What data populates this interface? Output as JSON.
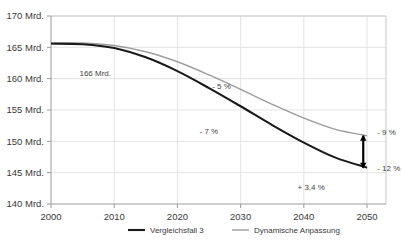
{
  "chart_data": {
    "type": "line",
    "title": "",
    "xlabel": "",
    "ylabel": "",
    "xlim": [
      2000,
      2053
    ],
    "ylim": [
      140,
      170
    ],
    "grid": true,
    "legend_position": "bottom",
    "x_ticks": [
      "2000",
      "2010",
      "2020",
      "2030",
      "2040",
      "2050"
    ],
    "x_tick_values": [
      2000,
      2010,
      2020,
      2030,
      2040,
      2050
    ],
    "y_ticks": [
      "140 Mrd.",
      "145 Mrd.",
      "150 Mrd.",
      "155 Mrd.",
      "160 Mrd.",
      "165 Mrd.",
      "170 Mrd."
    ],
    "y_tick_values": [
      140,
      145,
      150,
      155,
      160,
      165,
      170
    ],
    "x": [
      2000,
      2005,
      2010,
      2015,
      2020,
      2025,
      2030,
      2035,
      2040,
      2045,
      2050
    ],
    "series": [
      {
        "name": "Vergleichsfall 3",
        "color": "#1a1a1a",
        "values": [
          165.6,
          165.5,
          164.9,
          163.4,
          161.2,
          158.5,
          155.6,
          152.6,
          149.8,
          147.4,
          145.8
        ]
      },
      {
        "name": "Dynamische Anpassung",
        "color": "#9c9c9c",
        "values": [
          165.6,
          165.7,
          165.3,
          164.3,
          162.7,
          160.6,
          158.3,
          155.9,
          153.7,
          151.9,
          150.9
        ]
      }
    ],
    "annotations": [
      {
        "text": "166 Mrd.",
        "x": 2004.5,
        "y": 160.5,
        "name": "start-value-label"
      },
      {
        "text": "- 5 %",
        "x": 2025.5,
        "y": 158.3,
        "name": "minus-5-percent-label"
      },
      {
        "text": "- 7 %",
        "x": 2023.5,
        "y": 151.2,
        "name": "minus-7-percent-label"
      },
      {
        "text": "- 9 %",
        "x": 2051.6,
        "y": 151.0,
        "name": "minus-9-percent-label"
      },
      {
        "text": "- 12 %",
        "x": 2051.6,
        "y": 145.2,
        "name": "minus-12-percent-label"
      },
      {
        "text": "+ 3,4 %",
        "x": 2039.0,
        "y": 142.3,
        "name": "plus-3-4-percent-label"
      }
    ],
    "arrow": {
      "name": "gap-arrow",
      "x": 2049.4,
      "y_bottom": 145.8,
      "y_top": 150.9,
      "color": "#000000"
    }
  },
  "legend": {
    "items": [
      {
        "label": "Vergleichsfall 3",
        "color": "#1a1a1a"
      },
      {
        "label": "Dynamische Anpassung",
        "color": "#9c9c9c"
      }
    ]
  },
  "header": {
    "clipped_title": ""
  }
}
